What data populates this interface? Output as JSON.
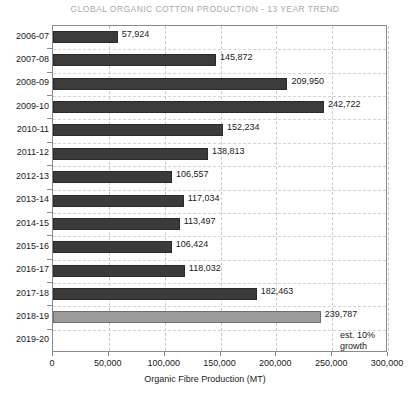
{
  "chart_data": {
    "type": "bar",
    "orientation": "horizontal",
    "title": "GLOBAL ORGANIC COTTON PRODUCTION - 13 YEAR TREND",
    "xlabel": "Organic Fibre Production (MT)",
    "ylabel": "",
    "xlim": [
      0,
      300000
    ],
    "xticks": [
      0,
      50000,
      100000,
      150000,
      200000,
      250000,
      300000
    ],
    "xtick_labels": [
      "0",
      "50,000",
      "100,000",
      "150,000",
      "200,000",
      "250,000",
      "300,000"
    ],
    "grid": true,
    "legend": "none",
    "categories": [
      "2006-07",
      "2007-08",
      "2008-09",
      "2009-10",
      "2010-11",
      "2011-12",
      "2012-13",
      "2013-14",
      "2014-15",
      "2015-16",
      "2016-17",
      "2017-18",
      "2018-19",
      "2019-20"
    ],
    "values": [
      57924,
      145872,
      209950,
      242722,
      152234,
      138813,
      106557,
      117034,
      113497,
      106424,
      118032,
      182463,
      239787,
      null
    ],
    "value_labels": [
      "57,924",
      "145,872",
      "209,950",
      "242,722",
      "152,234",
      "138,813",
      "106,557",
      "117,034",
      "113,497",
      "106,424",
      "118,032",
      "182,463",
      "239,787",
      ""
    ],
    "highlight_index": 12,
    "colors": {
      "bar": "#3b3b3b",
      "bar_highlight": "#9b9b9b",
      "grid": "#c9c9c9",
      "axis": "#8a8a8a",
      "title": "#a9a9a9",
      "text": "#1a1a1a"
    },
    "annotations": [
      {
        "text_line1": "est. 10%",
        "text_line2": "growth",
        "near_category": "2018-19"
      }
    ]
  }
}
